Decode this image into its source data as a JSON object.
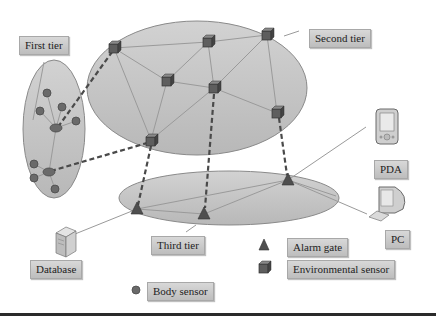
{
  "diagram": {
    "type": "three-tier body sensor network architecture",
    "labels": {
      "first_tier": "First tier",
      "second_tier": "Second tier",
      "third_tier": "Third tier",
      "database": "Database",
      "pda": "PDA",
      "pc": "PC"
    },
    "legend": {
      "alarm_gate": "Alarm gate",
      "environmental_sensor": "Environmental sensor",
      "body_sensor": "Body sensor"
    },
    "colors": {
      "ellipse_fill": "#c4c4c4",
      "ellipse_stroke": "#8a8a8a",
      "node_fill": "#5c5c5c",
      "link": "#9a9a9a",
      "dashed_link": "#4a4a4a",
      "label_bg": "#c8c8c8"
    },
    "nodes": {
      "body_sensors": 9,
      "body_hubs": 2,
      "environmental_sensors": 7,
      "alarm_gates": 3
    }
  }
}
